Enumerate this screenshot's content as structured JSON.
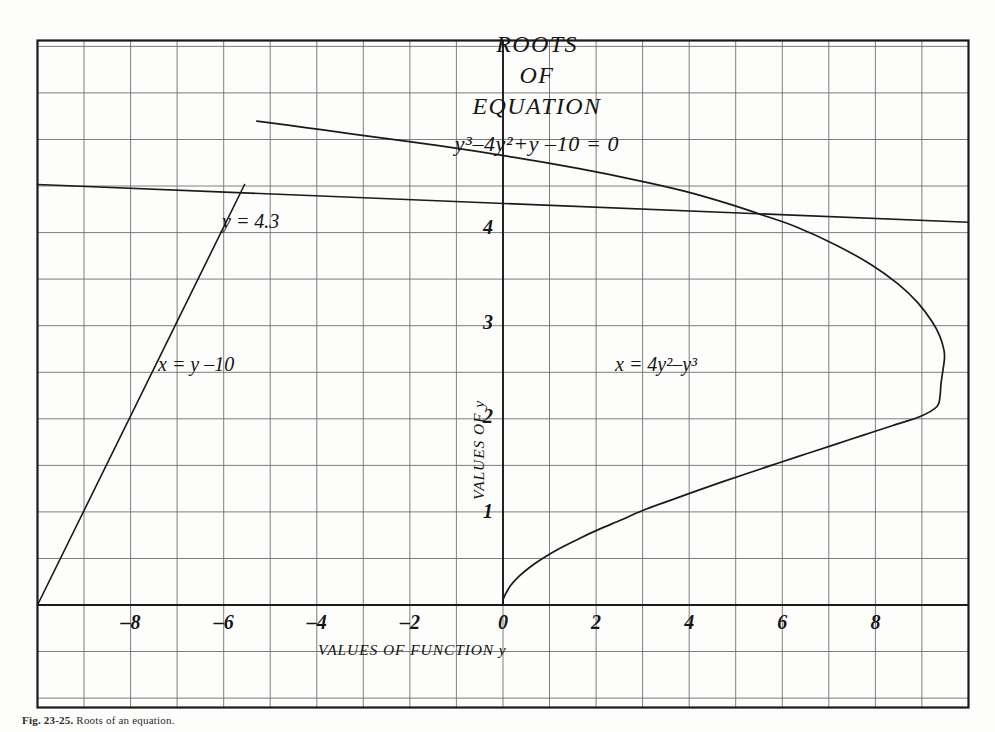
{
  "figure": {
    "title_lines": [
      "ROOTS",
      "OF",
      "EQUATION"
    ],
    "equation": "y³–4y²+y –10 = 0",
    "caption_number": "Fig. 23-25.",
    "caption_text": "Roots of an equation."
  },
  "axes": {
    "x_title": "VALUES OF FUNCTION y",
    "y_title": "VALUES OF y",
    "x_ticks": [
      "–8",
      "–6",
      "–4",
      "–2",
      "0",
      "2",
      "4",
      "6",
      "8"
    ],
    "x_tick_values": [
      -8,
      -6,
      -4,
      -2,
      0,
      2,
      4,
      6,
      8
    ],
    "y_ticks": [
      "1",
      "2",
      "3",
      "4"
    ],
    "y_tick_values": [
      1,
      2,
      3,
      4
    ]
  },
  "annotations": {
    "root_label": "y = 4.3",
    "line_label": "x = y –10",
    "curve_label": "x = 4y²–y³"
  },
  "colors": {
    "ink": "#1a1a1a",
    "grid": "#6f6f6f",
    "border": "#1a1a1a",
    "paper": "#fdfdfc"
  },
  "chart_data": {
    "type": "line",
    "xlabel": "VALUES OF FUNCTION y",
    "ylabel": "VALUES OF y",
    "xlim": [
      -10,
      10
    ],
    "ylim": [
      -0.6,
      6.5
    ],
    "grid": true,
    "legend": "none",
    "x_ticks": [
      -8,
      -6,
      -4,
      -2,
      0,
      2,
      4,
      6,
      8
    ],
    "y_ticks": [
      1,
      2,
      3,
      4
    ],
    "series": [
      {
        "name": "x = 4y²–y³",
        "type": "curve",
        "label": "x = 4y²–y³",
        "label_at": [
          3.3,
          2.35
        ],
        "points_xy": [
          [
            0,
            0
          ],
          [
            0.0,
            0.05
          ],
          [
            0.0396,
            0.1
          ],
          [
            0.1538,
            0.2
          ],
          [
            0.3352,
            0.3
          ],
          [
            0.576,
            0.4
          ],
          [
            0.875,
            0.5
          ],
          [
            1.2254,
            0.6
          ],
          [
            1.6219,
            0.7
          ],
          [
            2.0602,
            0.8
          ],
          [
            2.5358,
            0.9
          ],
          [
            3.0,
            1.0
          ],
          [
            3.549,
            1.1
          ],
          [
            4.1126,
            1.2
          ],
          [
            4.6947,
            1.3
          ],
          [
            5.2919,
            1.4
          ],
          [
            5.9006,
            1.5
          ],
          [
            6.5171,
            1.6
          ],
          [
            7.1377,
            1.7
          ],
          [
            7.7587,
            1.8
          ],
          [
            8.3764,
            1.9
          ],
          [
            8.9869,
            2.0
          ],
          [
            9.3236,
            2.1
          ],
          [
            9.3849,
            2.2
          ],
          [
            9.4117,
            2.35
          ],
          [
            9.4814,
            2.6
          ],
          [
            9.4725,
            2.7
          ],
          [
            9.3789,
            2.85
          ],
          [
            9.2164,
            3.0
          ],
          [
            8.9088,
            3.2
          ],
          [
            8.4787,
            3.4
          ],
          [
            7.9115,
            3.6
          ],
          [
            7.1916,
            3.8
          ],
          [
            6.3037,
            4.0
          ],
          [
            5.6139,
            4.12
          ],
          [
            4.8163,
            4.25
          ],
          [
            3.8946,
            4.38
          ],
          [
            2.8315,
            4.5
          ],
          [
            1.6096,
            4.62
          ],
          [
            0.2114,
            4.74
          ],
          [
            -1.3808,
            4.86
          ],
          [
            -3.1847,
            4.98
          ],
          [
            -4.2028,
            5.05
          ],
          [
            -5.2864,
            5.12
          ]
        ]
      },
      {
        "name": "x = y –10",
        "type": "line",
        "label": "x = y –10",
        "label_at": [
          -7.4,
          2.4
        ],
        "points_xy": [
          [
            -10,
            0
          ],
          [
            -5.55,
            4.45
          ]
        ]
      },
      {
        "name": "y = 4.3 root line",
        "type": "hline",
        "label": "y = 4.3",
        "label_at": [
          -6.3,
          4.33
        ],
        "points_xy": [
          [
            -10,
            4.45
          ],
          [
            10,
            4.05
          ]
        ]
      }
    ],
    "annotations": [
      {
        "text": "y = 4.3",
        "x": -6.3,
        "y": 4.33
      },
      {
        "text": "x = y –10",
        "x": -7.4,
        "y": 2.4
      },
      {
        "text": "x = 4y²–y³",
        "x": 3.3,
        "y": 2.35
      }
    ]
  }
}
